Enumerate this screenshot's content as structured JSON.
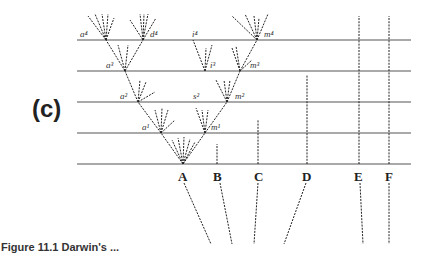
{
  "panel_label": "(c)",
  "caption": "Figure 11.1  Darwin's ...",
  "species": [
    "A",
    "B",
    "C",
    "D",
    "E",
    "F"
  ],
  "node_labels": {
    "a4": "a⁴",
    "d4": "d⁴",
    "i4": "i⁴",
    "m4": "m⁴",
    "a3": "a³",
    "i3": "i³",
    "m3": "m³",
    "a2": "a²",
    "s2": "s²",
    "m2": "m²",
    "a1": "a¹",
    "m1": "m¹"
  }
}
